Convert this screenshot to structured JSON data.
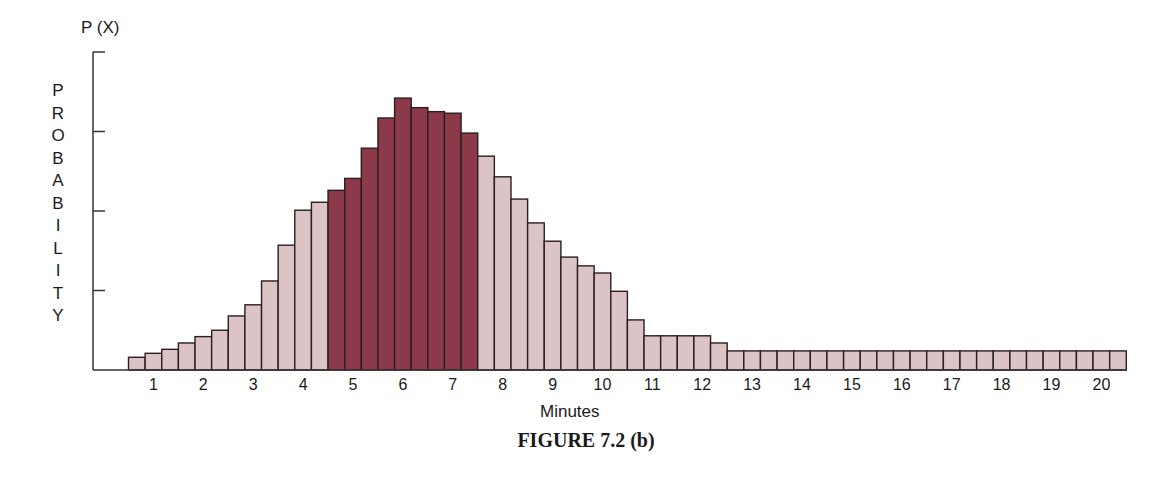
{
  "chart_data": {
    "type": "bar",
    "title": "FIGURE 7.2 (b)",
    "xlabel": "Minutes",
    "ylabel": "PROBABILITY",
    "ylabel_top": "P (X)",
    "x_ticks": [
      "1",
      "2",
      "3",
      "4",
      "5",
      "6",
      "7",
      "8",
      "9",
      "10",
      "11",
      "12",
      "13",
      "14",
      "15",
      "16",
      "17",
      "18",
      "19",
      "20"
    ],
    "bars_per_minute": 3,
    "y_axis": {
      "ticks_unlabeled": 4,
      "range": [
        0,
        4
      ],
      "tick_label_text": "none"
    },
    "grid": false,
    "legend": null,
    "highlight_range_minutes": [
      4.5,
      7.5
    ],
    "colors": {
      "normal": "#dcc3c6",
      "highlight": "#8c3a4a",
      "edge": "#2a1e1f",
      "axis": "#333333"
    },
    "x_centers": [
      0.67,
      1.0,
      1.33,
      1.67,
      2.0,
      2.33,
      2.67,
      3.0,
      3.33,
      3.67,
      4.0,
      4.33,
      4.67,
      5.0,
      5.33,
      5.67,
      6.0,
      6.33,
      6.67,
      7.0,
      7.33,
      7.67,
      8.0,
      8.33,
      8.67,
      9.0,
      9.33,
      9.67,
      10.0,
      10.33,
      10.67,
      11.0,
      11.33,
      11.67,
      12.0,
      12.33,
      12.67,
      13.0,
      13.33,
      13.67,
      14.0,
      14.33,
      14.67,
      15.0,
      15.33,
      15.67,
      16.0,
      16.33,
      16.67,
      17.0,
      17.33,
      17.67,
      18.0,
      18.33,
      18.67,
      19.0,
      19.33,
      19.67,
      20.0,
      20.33
    ],
    "values": [
      0.16,
      0.21,
      0.26,
      0.34,
      0.42,
      0.5,
      0.68,
      0.82,
      1.12,
      1.57,
      2.01,
      2.11,
      2.26,
      2.41,
      2.79,
      3.17,
      3.42,
      3.3,
      3.25,
      3.23,
      2.98,
      2.69,
      2.43,
      2.15,
      1.85,
      1.62,
      1.42,
      1.31,
      1.22,
      0.99,
      0.63,
      0.43,
      0.43,
      0.43,
      0.43,
      0.34,
      0.24,
      0.24,
      0.24,
      0.24,
      0.24,
      0.24,
      0.24,
      0.24,
      0.24,
      0.24,
      0.24,
      0.24,
      0.24,
      0.24,
      0.24,
      0.24,
      0.24,
      0.24,
      0.24,
      0.24,
      0.24,
      0.24,
      0.24,
      0.24
    ],
    "highlighted": [
      false,
      false,
      false,
      false,
      false,
      false,
      false,
      false,
      false,
      false,
      false,
      false,
      true,
      true,
      true,
      true,
      true,
      true,
      true,
      true,
      true,
      false,
      false,
      false,
      false,
      false,
      false,
      false,
      false,
      false,
      false,
      false,
      false,
      false,
      false,
      false,
      false,
      false,
      false,
      false,
      false,
      false,
      false,
      false,
      false,
      false,
      false,
      false,
      false,
      false,
      false,
      false,
      false,
      false,
      false,
      false,
      false,
      false,
      false,
      false
    ]
  }
}
